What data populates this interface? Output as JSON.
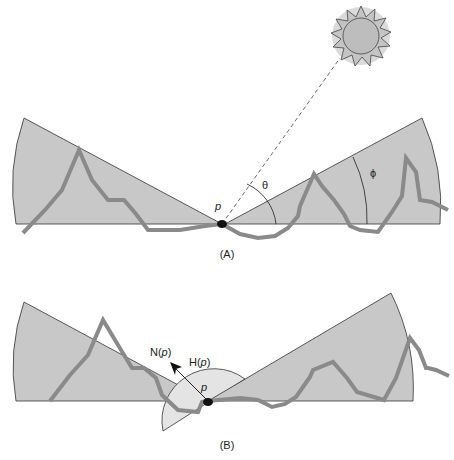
{
  "panels": {
    "a": {
      "caption": "(A)",
      "point_label": "p",
      "zenith_angle_label": "θ",
      "horizon_angle_label": "ϕ"
    },
    "b": {
      "caption": "(B)",
      "point_label": "p",
      "normal_label_prefix": "N(",
      "normal_label_var": "p",
      "normal_label_suffix": ")",
      "hemisphere_label_prefix": "H(",
      "hemisphere_label_var": "p",
      "hemisphere_label_suffix": ")"
    }
  },
  "colors": {
    "wedge_fill": "#c8c8c8",
    "hemisphere_fill": "#e4e4e4",
    "terrain_stroke": "#8a8a8a",
    "outline": "#333333",
    "sun_fill": "#c0c0c0",
    "sun_glow": "#d6d6d6"
  }
}
